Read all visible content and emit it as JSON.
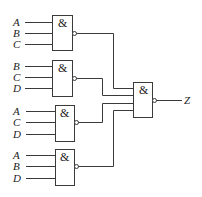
{
  "diagram": {
    "type": "logic-circuit",
    "gate_symbol": "&",
    "output_label": "Z",
    "gates": [
      {
        "id": "G1",
        "symbol": "&",
        "inputs": [
          "A",
          "B",
          "C"
        ],
        "inverted_output": true
      },
      {
        "id": "G2",
        "symbol": "&",
        "inputs": [
          "B",
          "C",
          "D"
        ],
        "inverted_output": true
      },
      {
        "id": "G3",
        "symbol": "&",
        "inputs": [
          "A",
          "C",
          "D"
        ],
        "inverted_output": true
      },
      {
        "id": "G4",
        "symbol": "&",
        "inputs": [
          "A",
          "B",
          "D"
        ],
        "inverted_output": true
      }
    ],
    "final_gate": {
      "id": "G5",
      "symbol": "&",
      "inputs": [
        "G1",
        "G2",
        "G3",
        "G4"
      ],
      "inverted_output": true,
      "output": "Z"
    },
    "colors": {
      "line": "#3a3a3a",
      "text": "#222222",
      "background": "#ffffff"
    }
  }
}
